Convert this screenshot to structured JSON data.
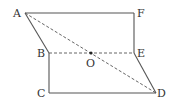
{
  "diagram": {
    "type": "geometry-figure",
    "colors": {
      "stroke": "#555555",
      "label": "#333333",
      "background": "#ffffff"
    },
    "points": {
      "A": {
        "label": "A",
        "x": 25,
        "y": 13
      },
      "F": {
        "label": "F",
        "x": 134,
        "y": 13
      },
      "B": {
        "label": "B",
        "x": 49,
        "y": 53
      },
      "O": {
        "label": "O",
        "x": 91,
        "y": 53
      },
      "E": {
        "label": "E",
        "x": 134,
        "y": 53
      },
      "C": {
        "label": "C",
        "x": 49,
        "y": 93
      },
      "D": {
        "label": "D",
        "x": 156,
        "y": 93
      }
    },
    "solid_segments": [
      [
        "A",
        "F"
      ],
      [
        "F",
        "E"
      ],
      [
        "A",
        "B"
      ],
      [
        "B",
        "C"
      ],
      [
        "C",
        "D"
      ],
      [
        "E",
        "D"
      ]
    ],
    "dashed_segments": [
      [
        "A",
        "D"
      ],
      [
        "B",
        "E"
      ]
    ],
    "marked_point": "O"
  }
}
